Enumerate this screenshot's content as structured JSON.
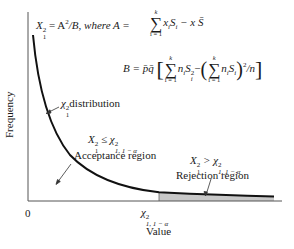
{
  "figure": {
    "formula_a": {
      "lhs": "X",
      "lhs_sup": "2",
      "lhs_sub": "1",
      "eq1": " = A",
      "eq1_sup": "2",
      "eq1_rest": "/B, where A = ",
      "sum_upper": "k",
      "sum_lower": "i = 1",
      "term": "x",
      "term_sub": "i",
      "term2": "S",
      "term2_sub": "i",
      "rest": " − x S̄"
    },
    "formula_b": {
      "lhs": "B = p̄q̄",
      "sum_upper": "k",
      "sum_lower": "i = 1",
      "term": "n",
      "term_sub": "i",
      "term2": "S",
      "term2_sup": "2",
      "term2_sub": "i",
      "minus": "−",
      "inner_sum_upper": "k",
      "inner_sum_lower": "i = 1",
      "inner_term": "n",
      "inner_term_sub": "i",
      "inner_term2": "S",
      "inner_term2_sub": "i",
      "tail_sup": "2",
      "tail": "/n"
    },
    "labels": {
      "distribution": "distribution",
      "distribution_symbol": "χ",
      "distribution_sup": "2",
      "distribution_sub": "1",
      "acceptance_condition_lhs": "X",
      "acceptance_condition_op": " ≤ χ",
      "acceptance_condition_sup": "2",
      "acceptance_condition_sub": "1, 1 − α",
      "acceptance_region": "Acceptance region",
      "rejection_condition_lhs": "X",
      "rejection_condition_op": " > χ",
      "rejection_condition_sup": "2",
      "rejection_condition_sub": "1, 1 − α",
      "rejection_region": "Rejection region"
    },
    "axes": {
      "ylabel": "Frequency",
      "xlabel": "Value",
      "origin_tick": "0",
      "critical_tick_symbol": "χ",
      "critical_tick_sup": "2",
      "critical_tick_sub": "1, 1 − α"
    },
    "colors": {
      "curve": "#111111",
      "axis": "#555555",
      "rejection_fill": "#c8c8c8"
    }
  }
}
